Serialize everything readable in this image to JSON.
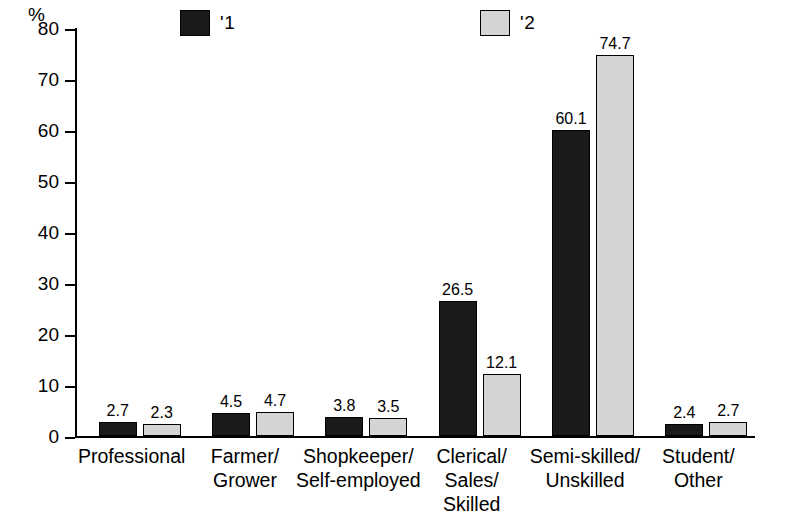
{
  "chart_data": {
    "type": "bar",
    "title": "",
    "xlabel": "",
    "ylabel": "%",
    "ylim": [
      0,
      80
    ],
    "ytick_labels": [
      "0",
      "10",
      "20",
      "30",
      "40",
      "50",
      "60",
      "70",
      "80"
    ],
    "grid": false,
    "legend_position": "top",
    "categories": [
      "Professional",
      "Farmer/\nGrower",
      "Shopkeeper/\nSelf-employed",
      "Clerical/\nSales/\nSkilled",
      "Semi-skilled/\nUnskilled",
      "Student/\nOther"
    ],
    "category_lines": [
      [
        "Professional"
      ],
      [
        "Farmer/",
        "Grower"
      ],
      [
        "Shopkeeper/",
        "Self-employed"
      ],
      [
        "Clerical/",
        "Sales/",
        "Skilled"
      ],
      [
        "Semi-skilled/",
        "Unskilled"
      ],
      [
        "Student/",
        "Other"
      ]
    ],
    "series": [
      {
        "name": "'1",
        "color": "#1a1a1a",
        "values": [
          2.7,
          4.5,
          3.8,
          26.5,
          60.1,
          2.4
        ],
        "labels": [
          "2.7",
          "4.5",
          "3.8",
          "26.5",
          "60.1",
          "2.4"
        ]
      },
      {
        "name": "'2",
        "color": "#d4d4d4",
        "values": [
          2.3,
          4.7,
          3.5,
          12.1,
          74.7,
          2.7
        ],
        "labels": [
          "2.3",
          "4.7",
          "3.5",
          "12.1",
          "74.7",
          "2.7"
        ]
      }
    ]
  },
  "legend": {
    "items": [
      {
        "label": "'1",
        "color": "#1a1a1a"
      },
      {
        "label": "'2",
        "color": "#d4d4d4"
      }
    ]
  },
  "axis": {
    "y_unit": "%"
  }
}
